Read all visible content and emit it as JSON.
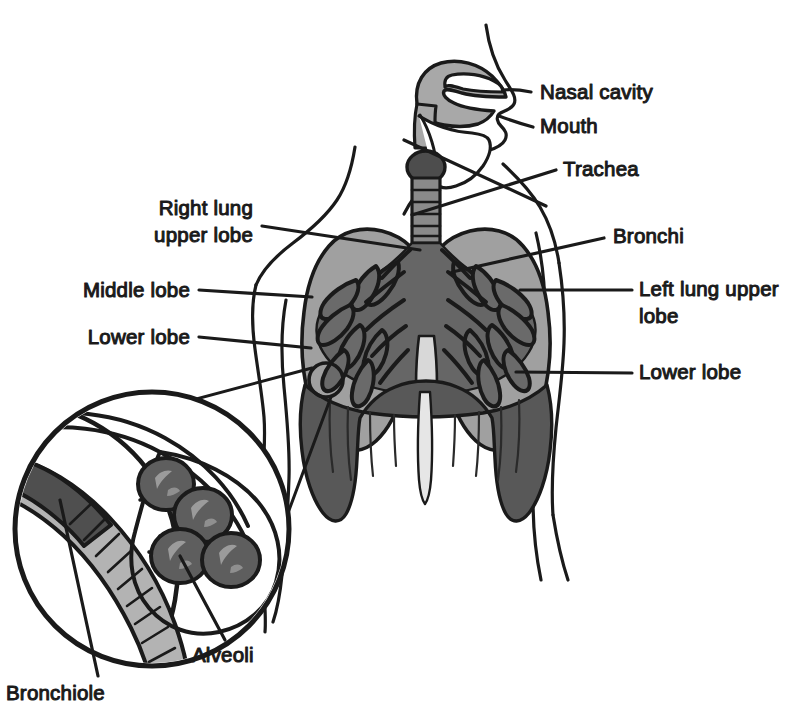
{
  "diagram": {
    "figure_type": "anatomical illustration",
    "style": "black and white line drawing with halftone gray fills",
    "colors": {
      "outline": "#1a1a1a",
      "background": "#ffffff",
      "lung_light_gray": "#9a9a9a",
      "bronchial_mid_gray": "#6e6e6e",
      "diaphragm_dark_gray": "#595959",
      "larynx_dark": "#4a4a4a",
      "airway_light": "#b0b0b0",
      "label_text": "#1a1a1a"
    },
    "labels": [
      {
        "id": "nasal-cavity",
        "text": "Nasal cavity",
        "side": "right",
        "x": 540,
        "y": 99,
        "lines": [
          "Nasal cavity"
        ]
      },
      {
        "id": "mouth",
        "text": "Mouth",
        "side": "right",
        "x": 540,
        "y": 133,
        "lines": [
          "Mouth"
        ]
      },
      {
        "id": "trachea",
        "text": "Trachea",
        "side": "right",
        "x": 563,
        "y": 176,
        "lines": [
          "Trachea"
        ]
      },
      {
        "id": "bronchi",
        "text": "Bronchi",
        "side": "right",
        "x": 613,
        "y": 243,
        "lines": [
          "Bronchi"
        ]
      },
      {
        "id": "left-lung-upper-lobe",
        "text": "Left lung upper lobe",
        "side": "right",
        "x": 639,
        "y": 296,
        "lines": [
          "Left lung upper",
          "lobe"
        ]
      },
      {
        "id": "lower-lobe-left",
        "text": "Lower lobe",
        "side": "right",
        "x": 639,
        "y": 379,
        "lines": [
          "Lower lobe"
        ]
      },
      {
        "id": "right-lung-upper-lobe",
        "text": "Right lung upper lobe",
        "side": "left",
        "x": 253,
        "y": 215,
        "lines": [
          "Right lung",
          "upper lobe"
        ]
      },
      {
        "id": "middle-lobe",
        "text": "Middle lobe",
        "side": "left",
        "x": 190,
        "y": 294,
        "lines": [
          "Middle lobe"
        ]
      },
      {
        "id": "lower-lobe-right",
        "text": "Lower lobe",
        "side": "left",
        "x": 190,
        "y": 341,
        "lines": [
          "Lower lobe"
        ]
      },
      {
        "id": "alveoli",
        "text": "Alveoli",
        "side": "bottom",
        "x": 192,
        "y": 662,
        "lines": [
          "Alveoli"
        ]
      },
      {
        "id": "bronchiole",
        "text": "Bronchiole",
        "side": "bottom",
        "x": 6,
        "y": 700,
        "lines": [
          "Bronchiole"
        ]
      }
    ],
    "parts": [
      {
        "id": "nasal-cavity",
        "name": "Nasal cavity"
      },
      {
        "id": "mouth",
        "name": "Mouth"
      },
      {
        "id": "larynx",
        "name": "Larynx"
      },
      {
        "id": "trachea",
        "name": "Trachea"
      },
      {
        "id": "bronchi",
        "name": "Bronchi"
      },
      {
        "id": "right-lung",
        "name": "Right lung"
      },
      {
        "id": "left-lung",
        "name": "Left lung"
      },
      {
        "id": "diaphragm",
        "name": "Diaphragm"
      },
      {
        "id": "bronchiole",
        "name": "Bronchiole"
      },
      {
        "id": "alveoli",
        "name": "Alveoli"
      }
    ],
    "inset": {
      "id": "alveoli-inset",
      "description": "Magnified circular inset showing a bronchiole terminating in a cluster of alveoli",
      "alveoli_count": 4,
      "center_x": 152,
      "center_y": 529,
      "radius": 137,
      "source_marker_x": 326,
      "source_marker_y": 380,
      "source_marker_r": 17
    }
  }
}
